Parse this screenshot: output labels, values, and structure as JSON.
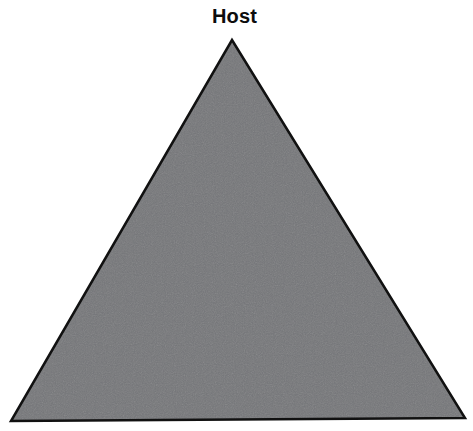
{
  "figure": {
    "type": "triangle-diagram",
    "background_color": "#ffffff",
    "canvas": {
      "width": 473,
      "height": 431
    },
    "labels": {
      "apex": "Host"
    },
    "shape": {
      "name": "triangle",
      "fill_color": "#76777a",
      "stroke_color": "#111111",
      "stroke_width": 2.5,
      "texture": "scan-grain",
      "vertices": {
        "apex": {
          "x": 232,
          "y": 40
        },
        "bottom_left": {
          "x": 11,
          "y": 421
        },
        "bottom_right": {
          "x": 465,
          "y": 418
        }
      },
      "points_attr": "232,40 465,418 11,421"
    }
  }
}
